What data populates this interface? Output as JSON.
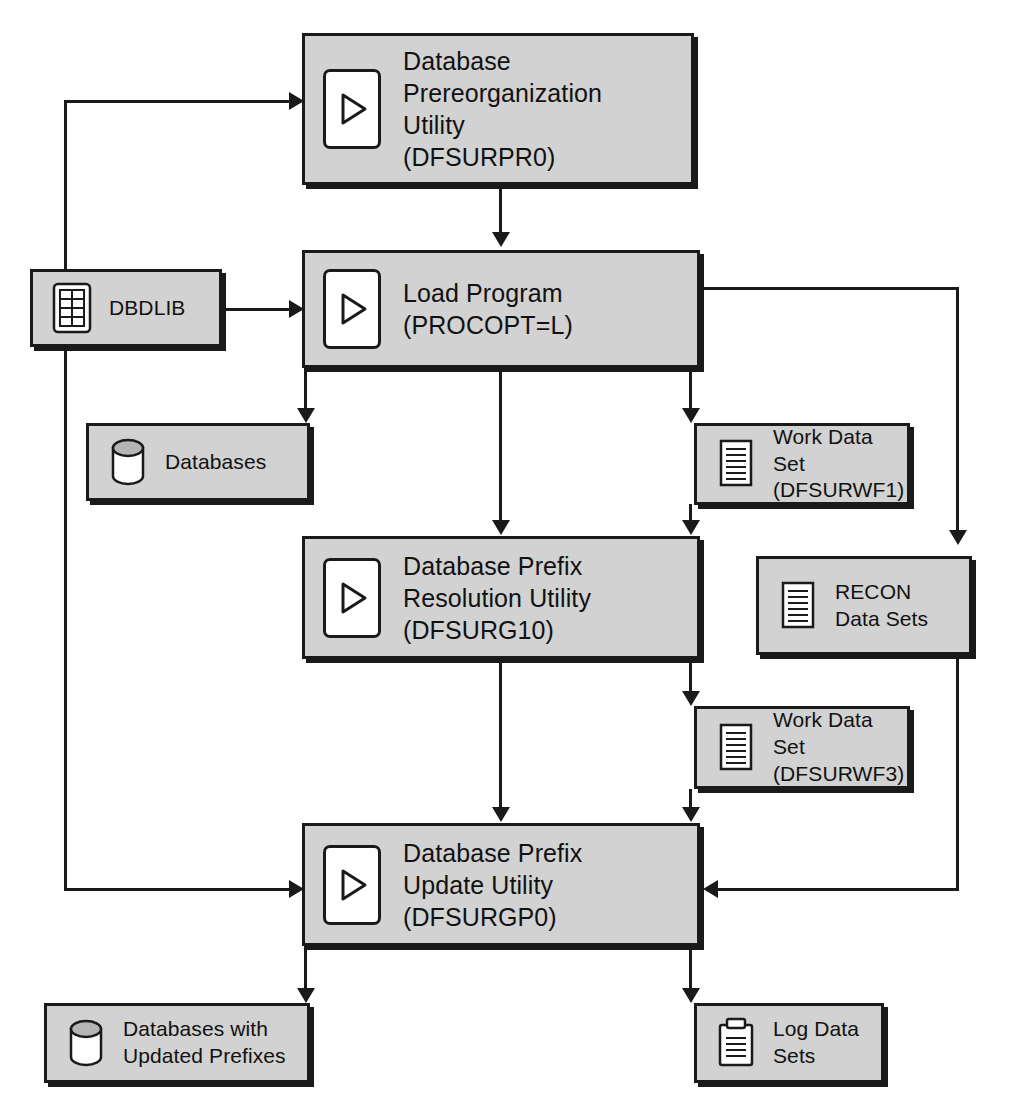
{
  "diagram": {
    "background": "#ffffff",
    "box_fill": "#d2d2d2",
    "box_border": "#1a1a1a",
    "nodes": [
      {
        "id": "prereorg",
        "kind": "process",
        "icon": "play-icon",
        "label": "Database\nPrereorganization\nUtility\n(DFSURPR0)"
      },
      {
        "id": "dbdlib",
        "kind": "data",
        "icon": "library-icon",
        "label": "DBDLIB"
      },
      {
        "id": "load",
        "kind": "process",
        "icon": "play-icon",
        "label": "Load Program\n(PROCOPT=L)"
      },
      {
        "id": "databases",
        "kind": "data",
        "icon": "cylinder-icon",
        "label": "Databases"
      },
      {
        "id": "wf1",
        "kind": "data",
        "icon": "document-icon",
        "label": "Work Data Set\n(DFSURWF1)"
      },
      {
        "id": "resolution",
        "kind": "process",
        "icon": "play-icon",
        "label": "Database Prefix\nResolution Utility\n(DFSURG10)"
      },
      {
        "id": "recon",
        "kind": "data",
        "icon": "document-icon",
        "label": "RECON\nData Sets"
      },
      {
        "id": "wf3",
        "kind": "data",
        "icon": "document-icon",
        "label": "Work Data Set\n(DFSURWF3)"
      },
      {
        "id": "update",
        "kind": "process",
        "icon": "play-icon",
        "label": "Database Prefix\nUpdate Utility\n(DFSURGP0)"
      },
      {
        "id": "dbupdated",
        "kind": "data",
        "icon": "cylinder-icon",
        "label": "Databases with\nUpdated Prefixes"
      },
      {
        "id": "logsets",
        "kind": "data",
        "icon": "clipboard-icon",
        "label": "Log Data\nSets"
      }
    ],
    "edges": [
      {
        "from": "dbdlib",
        "to": "prereorg",
        "direction": "up-right"
      },
      {
        "from": "prereorg",
        "to": "load",
        "direction": "down"
      },
      {
        "from": "dbdlib",
        "to": "load",
        "direction": "right"
      },
      {
        "from": "dbdlib",
        "to": "update",
        "direction": "down-right"
      },
      {
        "from": "load",
        "to": "databases",
        "direction": "down"
      },
      {
        "from": "load",
        "to": "resolution",
        "direction": "down"
      },
      {
        "from": "load",
        "to": "wf1",
        "direction": "down"
      },
      {
        "from": "load",
        "to": "recon",
        "direction": "right-down"
      },
      {
        "from": "wf1",
        "to": "resolution",
        "direction": "down"
      },
      {
        "from": "resolution",
        "to": "update",
        "direction": "down"
      },
      {
        "from": "resolution",
        "to": "wf3",
        "direction": "down"
      },
      {
        "from": "wf3",
        "to": "update",
        "direction": "down"
      },
      {
        "from": "recon",
        "to": "update",
        "direction": "down-left"
      },
      {
        "from": "update",
        "to": "dbupdated",
        "direction": "down"
      },
      {
        "from": "update",
        "to": "logsets",
        "direction": "down"
      }
    ]
  }
}
